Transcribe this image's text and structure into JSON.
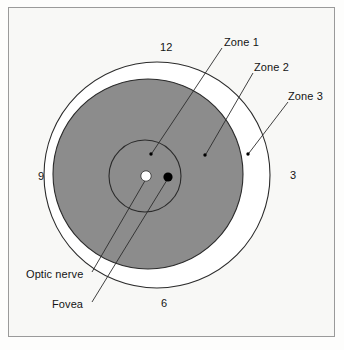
{
  "figure": {
    "background_color": "#f8f8f6",
    "frame_color": "#9a9a9a",
    "page_background": "#fdfdfc"
  },
  "colors": {
    "zone1_fill": "#8c8c8c",
    "zone2_fill": "#8c8c8c",
    "zone3_fill": "#ffffff",
    "stroke": "#2b2b2b",
    "optic_nerve_fill": "#ffffff",
    "fovea_fill": "#000000",
    "text": "#141414"
  },
  "clock_labels": [
    {
      "name": "clock-12",
      "text": "12",
      "x": 160,
      "y": 48
    },
    {
      "name": "clock-3",
      "text": "3",
      "x": 290,
      "y": 176
    },
    {
      "name": "clock-6",
      "text": "6",
      "x": 161,
      "y": 304
    },
    {
      "name": "clock-9",
      "text": "9",
      "x": 38,
      "y": 177
    }
  ],
  "zone_labels": [
    {
      "name": "zone-1",
      "text": "Zone 1",
      "label_x": 224,
      "label_y": 44,
      "leader": {
        "x1": 222,
        "y1": 48,
        "x2": 152,
        "y2": 153
      },
      "dot": {
        "cx": 151,
        "cy": 154,
        "r": 1.7
      }
    },
    {
      "name": "zone-2",
      "text": "Zone 2",
      "label_x": 254,
      "label_y": 69,
      "leader": {
        "x1": 253,
        "y1": 73,
        "x2": 206,
        "y2": 154
      },
      "dot": {
        "cx": 205,
        "cy": 155,
        "r": 1.7
      }
    },
    {
      "name": "zone-3",
      "text": "Zone 3",
      "label_x": 288,
      "label_y": 98,
      "leader": {
        "x1": 288,
        "y1": 102,
        "x2": 249,
        "y2": 153
      },
      "dot": {
        "cx": 248,
        "cy": 154,
        "r": 1.7
      }
    }
  ],
  "anatomy_labels": [
    {
      "name": "optic-nerve",
      "text": "Optic nerve",
      "label_x": 26,
      "label_y": 276,
      "leader": {
        "x1": 92,
        "y1": 272,
        "x2": 146,
        "y2": 179
      },
      "marker": {
        "cx": 146,
        "cy": 176,
        "r": 5.2,
        "fill": "#ffffff"
      }
    },
    {
      "name": "fovea",
      "text": "Fovea",
      "label_x": 52,
      "label_y": 306,
      "leader": {
        "x1": 92,
        "y1": 302,
        "x2": 167,
        "y2": 180
      },
      "marker": {
        "cx": 168,
        "cy": 177,
        "r": 4.6,
        "fill": "#000000"
      }
    }
  ],
  "circles": {
    "zone3_outer": {
      "cx": 157,
      "cy": 175,
      "r": 113,
      "fill": "#ffffff",
      "stroke": "#2b2b2b"
    },
    "zone2_middle": {
      "cx": 148,
      "cy": 174,
      "r": 95,
      "fill": "#8c8c8c",
      "stroke": "#2b2b2b"
    },
    "zone1_inner": {
      "cx": 145,
      "cy": 176,
      "r": 36,
      "fill": "#8c8c8c",
      "stroke": "#2b2b2b"
    }
  },
  "chart_data": {
    "type": "diagram",
    "zones": [
      {
        "label": "Zone 1",
        "radius": 36,
        "fill": "#8c8c8c"
      },
      {
        "label": "Zone 2",
        "radius": 95,
        "fill": "#8c8c8c"
      },
      {
        "label": "Zone 3",
        "radius": 113,
        "fill": "#ffffff"
      }
    ],
    "landmarks": [
      {
        "label": "Optic nerve",
        "fill": "#ffffff"
      },
      {
        "label": "Fovea",
        "fill": "#000000"
      }
    ],
    "meridians": [
      "12",
      "3",
      "6",
      "9"
    ]
  }
}
